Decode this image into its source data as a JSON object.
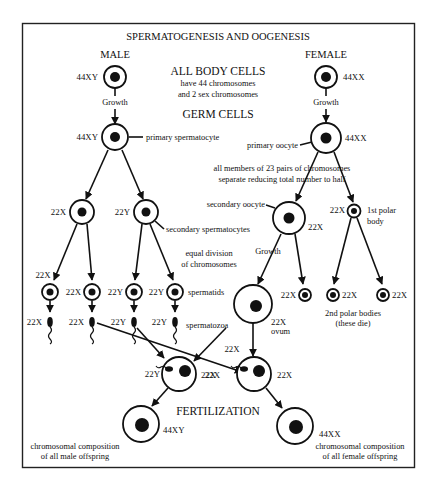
{
  "title": "SPERMATOGENESIS AND OOGENESIS",
  "columns": {
    "male": "MALE",
    "female": "FEMALE"
  },
  "center_notes": {
    "body_cells_heading": "ALL BODY CELLS",
    "body_cells_line1": "have 44 chromosomes",
    "body_cells_line2": "and 2 sex chromosomes",
    "germ_cells_heading": "GERM CELLS",
    "reduction_line1": "all members of 23 pairs of chromosomes",
    "reduction_line2": "separate reducing total number to half",
    "equal_line1": "equal division",
    "equal_line2": "of chromosomes",
    "fertilization": "FERTILIZATION"
  },
  "male": {
    "body_cell": "44XY",
    "growth": "Growth",
    "primary": {
      "genotype": "44XY",
      "label": "primary spermatocyte"
    },
    "secondary": {
      "genotypes": [
        "22X",
        "22Y"
      ],
      "label": "secondary spermatocytes"
    },
    "spermatids": {
      "genotypes": [
        "22X",
        "22X",
        "22Y",
        "22Y"
      ],
      "label": "spermatids"
    },
    "spermatozoa": {
      "genotypes": [
        "22X",
        "22X",
        "22Y",
        "22Y"
      ],
      "label": "spermatozoa"
    }
  },
  "female": {
    "body_cell": "44XX",
    "growth": "Growth",
    "primary": {
      "genotype": "44XX",
      "label": "primary oocyte"
    },
    "secondary": {
      "genotype": "22X",
      "label": "secondary oocyte"
    },
    "first_polar": {
      "genotype": "22X",
      "label_line1": "1st polar",
      "label_line2": "body"
    },
    "growth2": "Growth",
    "ovum": {
      "genotype": "22X",
      "label": "ovum"
    },
    "second_polar": {
      "genotypes": [
        "22X",
        "22X",
        "22X"
      ],
      "label_line1": "2nd polar bodies",
      "label_line2": "(these die)"
    }
  },
  "fertilization": {
    "zygote_male": {
      "sperm": "22Y",
      "egg": "22X",
      "result": "44XY",
      "caption_line1": "chromosomal composition",
      "caption_line2": "of all male offspring"
    },
    "zygote_female": {
      "sperm": "22X",
      "egg": "22X",
      "result": "44XX",
      "caption_line1": "chromosomal composition",
      "caption_line2": "of all female offspring"
    }
  }
}
